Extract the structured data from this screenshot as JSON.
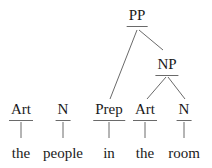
{
  "tree": {
    "phrase_nodes": [
      {
        "id": "pp",
        "label": "PP"
      },
      {
        "id": "np",
        "label": "NP"
      }
    ],
    "category_nodes": [
      {
        "id": "art1",
        "label": "Art"
      },
      {
        "id": "n1",
        "label": "N"
      },
      {
        "id": "prep",
        "label": "Prep"
      },
      {
        "id": "art2",
        "label": "Art"
      },
      {
        "id": "n2",
        "label": "N"
      }
    ],
    "words": [
      "the",
      "people",
      "in",
      "the",
      "room"
    ],
    "edges": [
      [
        "pp",
        "prep"
      ],
      [
        "pp",
        "np"
      ],
      [
        "np",
        "art2"
      ],
      [
        "np",
        "n2"
      ],
      [
        "art1",
        "the"
      ],
      [
        "n1",
        "people"
      ],
      [
        "prep",
        "in"
      ],
      [
        "art2",
        "the"
      ],
      [
        "n2",
        "room"
      ]
    ]
  },
  "colors": {
    "text": "#1a1a1a",
    "line": "#6a6a6a",
    "background": "#ffffff"
  }
}
